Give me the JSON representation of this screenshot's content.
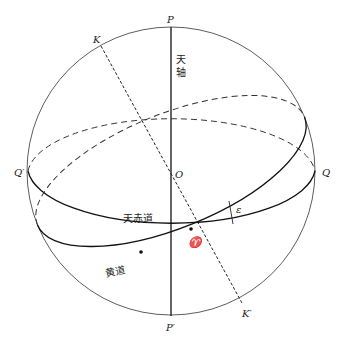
{
  "diagram": {
    "type": "celestial-sphere",
    "points": {
      "north_pole": "P",
      "south_pole": "P′",
      "center": "O",
      "equator_left": "Q′",
      "equator_right": "Q",
      "ecliptic_pole_north": "K",
      "ecliptic_pole_south": "K′",
      "vernal_equinox": "♈",
      "obliquity": "ε"
    },
    "labels": {
      "celestial_axis_1": "天",
      "celestial_axis_2": "轴",
      "celestial_equator": "天赤道",
      "ecliptic": "黄道"
    },
    "colors": {
      "line": "#222222",
      "background": "#ffffff"
    }
  }
}
